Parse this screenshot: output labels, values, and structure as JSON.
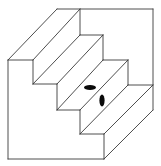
{
  "figure": {
    "title": "Schröder staircase with two ellipses",
    "colors": {
      "background": "#ffffff",
      "line": "#3a3a3a",
      "marker": "#0a0a0a"
    },
    "step_count": 4,
    "markers": [
      {
        "id": "ellipse-horizontal",
        "orientation": "horizontal"
      },
      {
        "id": "ellipse-vertical",
        "orientation": "vertical"
      }
    ]
  }
}
